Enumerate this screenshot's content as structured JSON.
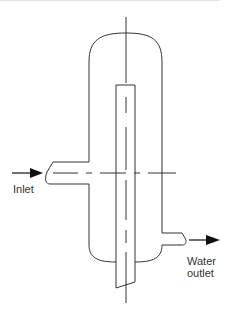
{
  "diagram": {
    "type": "vessel-schematic",
    "labels": {
      "inlet": "Inlet",
      "outlet_line1": "Water",
      "outlet_line2": "outlet"
    },
    "colors": {
      "stroke": "#333333",
      "background": "#ffffff",
      "top_rule": "#e4e4e4"
    },
    "components": [
      {
        "name": "vessel-shell",
        "description": "Vertical vessel with rounded top and bottom heads"
      },
      {
        "name": "internal-tube",
        "description": "Vertical tube extending through the vessel, slanted cut at bottom"
      },
      {
        "name": "inlet-nozzle",
        "description": "Side inlet nozzle on left wall, flow arrow pointing into vessel"
      },
      {
        "name": "water-outlet-nozzle",
        "description": "Outlet nozzle on lower right wall, flow arrow pointing out"
      },
      {
        "name": "vertical-centerline",
        "description": "Dash-dot centerline through vessel axis"
      },
      {
        "name": "horizontal-centerline",
        "description": "Dash-dot centerline through inlet nozzle axis"
      }
    ]
  }
}
